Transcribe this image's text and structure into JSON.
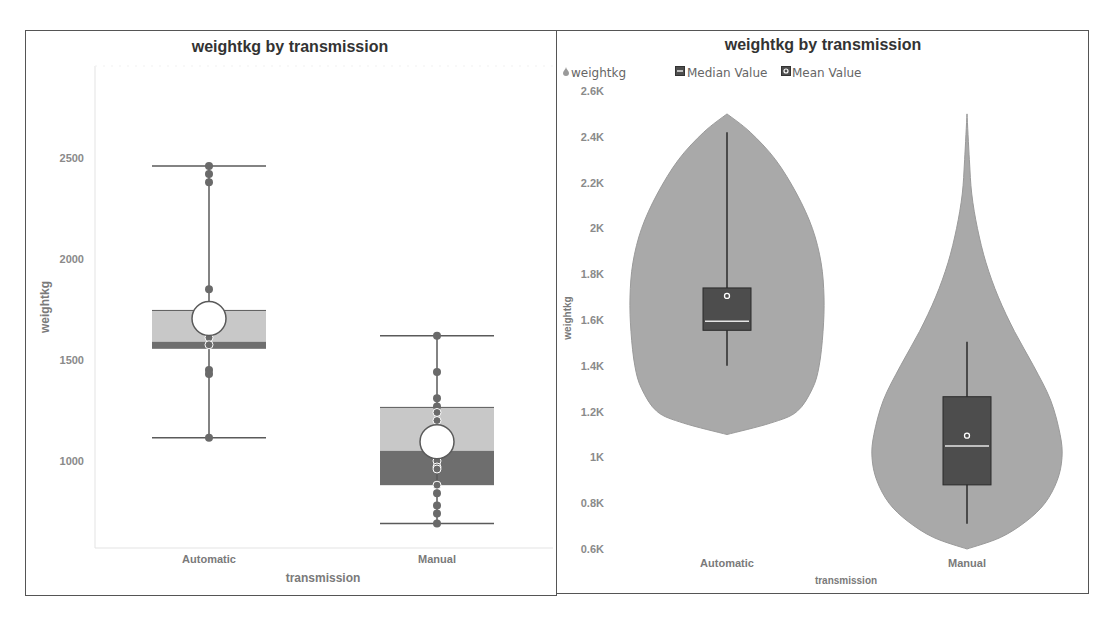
{
  "chart_data": [
    {
      "type": "box",
      "title": "weightkg by transmission",
      "xlabel": "transmission",
      "ylabel": "weightkg",
      "ylim": [
        569,
        2955
      ],
      "yticks": [
        {
          "value": 1000,
          "label": "1000"
        },
        {
          "value": 1500,
          "label": "1500"
        },
        {
          "value": 2000,
          "label": "2000"
        },
        {
          "value": 2500,
          "label": "2500"
        }
      ],
      "grid": false,
      "categories": [
        "Automatic",
        "Manual"
      ],
      "boxes": [
        {
          "category": "Automatic",
          "whisker_low": 1115,
          "q1": 1555,
          "median": 1590,
          "q3": 1745,
          "whisker_high": 2460,
          "mean": 1705,
          "points": [
            2460,
            2420,
            2380,
            1850,
            1640,
            1610,
            1575,
            1450,
            1430,
            1115
          ]
        },
        {
          "category": "Manual",
          "whisker_low": 690,
          "q1": 880,
          "median": 1050,
          "q3": 1265,
          "whisker_high": 1620,
          "mean": 1095,
          "points": [
            1620,
            1440,
            1310,
            1270,
            1240,
            1200,
            1000,
            970,
            960,
            880,
            840,
            780,
            740,
            690
          ]
        }
      ],
      "colors": {
        "upper_box": "#c8c8c8",
        "lower_box": "#6e6e6e",
        "line": "#5a5a5a",
        "point": "#6a6a6a",
        "mean_fill": "#ffffff"
      }
    },
    {
      "type": "violin",
      "title": "weightkg by transmission",
      "xlabel": "transmission",
      "ylabel": "weightkg",
      "ylim": [
        600,
        2600
      ],
      "yticks": [
        {
          "value": 600,
          "label": "0.6K"
        },
        {
          "value": 800,
          "label": "0.8K"
        },
        {
          "value": 1000,
          "label": "1K"
        },
        {
          "value": 1200,
          "label": "1.2K"
        },
        {
          "value": 1400,
          "label": "1.4K"
        },
        {
          "value": 1600,
          "label": "1.6K"
        },
        {
          "value": 1800,
          "label": "1.8K"
        },
        {
          "value": 2000,
          "label": "2K"
        },
        {
          "value": 2200,
          "label": "2.2K"
        },
        {
          "value": 2400,
          "label": "2.4K"
        },
        {
          "value": 2600,
          "label": "2.6K"
        }
      ],
      "grid": false,
      "legend": {
        "position": "top-left",
        "entries": [
          {
            "label": "weightkg",
            "icon": "violin-marker"
          },
          {
            "label": "Median Value",
            "icon": "median-marker"
          },
          {
            "label": "Mean Value",
            "icon": "mean-marker"
          }
        ]
      },
      "categories": [
        "Automatic",
        "Manual"
      ],
      "violins": [
        {
          "category": "Automatic",
          "range": [
            1100,
            2500
          ],
          "density": [
            {
              "value": 1100,
              "width": 0.0
            },
            {
              "value": 1150,
              "width": 0.45
            },
            {
              "value": 1200,
              "width": 0.72
            },
            {
              "value": 1300,
              "width": 0.88
            },
            {
              "value": 1400,
              "width": 0.95
            },
            {
              "value": 1550,
              "width": 0.99
            },
            {
              "value": 1700,
              "width": 1.0
            },
            {
              "value": 1850,
              "width": 0.97
            },
            {
              "value": 2000,
              "width": 0.88
            },
            {
              "value": 2150,
              "width": 0.72
            },
            {
              "value": 2300,
              "width": 0.5
            },
            {
              "value": 2420,
              "width": 0.24
            },
            {
              "value": 2500,
              "width": 0.0
            }
          ],
          "whisker_low": 1400,
          "q1": 1555,
          "median": 1595,
          "q3": 1740,
          "whisker_high": 2420,
          "mean": 1705
        },
        {
          "category": "Manual",
          "range": [
            600,
            2500
          ],
          "density": [
            {
              "value": 600,
              "width": 0.0
            },
            {
              "value": 650,
              "width": 0.35
            },
            {
              "value": 720,
              "width": 0.62
            },
            {
              "value": 800,
              "width": 0.82
            },
            {
              "value": 900,
              "width": 0.95
            },
            {
              "value": 1000,
              "width": 1.0
            },
            {
              "value": 1100,
              "width": 0.98
            },
            {
              "value": 1250,
              "width": 0.88
            },
            {
              "value": 1400,
              "width": 0.7
            },
            {
              "value": 1550,
              "width": 0.5
            },
            {
              "value": 1700,
              "width": 0.33
            },
            {
              "value": 1850,
              "width": 0.2
            },
            {
              "value": 2000,
              "width": 0.11
            },
            {
              "value": 2150,
              "width": 0.05
            },
            {
              "value": 2300,
              "width": 0.025
            },
            {
              "value": 2500,
              "width": 0.0
            }
          ],
          "whisker_low": 710,
          "q1": 880,
          "median": 1050,
          "q3": 1265,
          "whisker_high": 1505,
          "mean": 1095
        }
      ],
      "colors": {
        "violin": "#a9a9a9",
        "box": "#4d4d4d",
        "median": "#e6e6e6",
        "whisker": "#2b2b2b",
        "mean": "#ffffff"
      }
    }
  ]
}
